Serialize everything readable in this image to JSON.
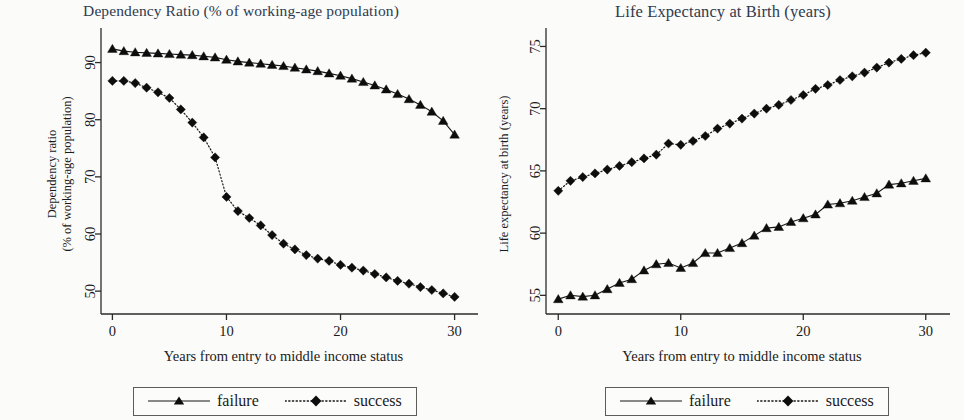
{
  "figure": {
    "background": "#fbfbfa",
    "title_color": "#2f3a4e",
    "series_color": "#0d0d0d"
  },
  "panels": [
    {
      "id": "dependency-ratio",
      "title": "Dependency Ratio (% of working-age population)",
      "y_axis_title_line1": "Dependency ratio",
      "y_axis_title_line2": "(% of working-age population)",
      "x_axis_title": "Years from entry to middle income status",
      "y_ticks": [
        "50",
        "60",
        "70",
        "80",
        "90"
      ],
      "x_ticks": [
        "0",
        "10",
        "20",
        "30"
      ],
      "legend": [
        {
          "label": "failure",
          "marker": "triangle",
          "line": "solid"
        },
        {
          "label": "success",
          "marker": "diamond",
          "line": "dotted"
        }
      ]
    },
    {
      "id": "life-expectancy",
      "title": "Life Expectancy at Birth (years)",
      "y_axis_title_line1": "Life expectancy at birth (years)",
      "y_axis_title_line2": "",
      "x_axis_title": "Years from entry to middle income status",
      "y_ticks": [
        "55",
        "60",
        "65",
        "70",
        "75"
      ],
      "x_ticks": [
        "0",
        "10",
        "20",
        "30"
      ],
      "legend": [
        {
          "label": "failure",
          "marker": "triangle",
          "line": "solid"
        },
        {
          "label": "success",
          "marker": "diamond",
          "line": "dotted"
        }
      ]
    }
  ],
  "chart_data": [
    {
      "type": "line",
      "title": "Dependency Ratio (% of working-age population)",
      "xlabel": "Years from entry to middle income status",
      "ylabel": "Dependency ratio (% of working-age population)",
      "xlim": [
        -1,
        31
      ],
      "ylim": [
        46,
        95
      ],
      "xticks": [
        0,
        10,
        20,
        30
      ],
      "yticks": [
        50,
        60,
        70,
        80,
        90
      ],
      "grid": false,
      "legend_position": "bottom-center",
      "x": [
        0,
        1,
        2,
        3,
        4,
        5,
        6,
        7,
        8,
        9,
        10,
        11,
        12,
        13,
        14,
        15,
        16,
        17,
        18,
        19,
        20,
        21,
        22,
        23,
        24,
        25,
        26,
        27,
        28,
        29,
        30
      ],
      "series": [
        {
          "name": "failure",
          "marker": "triangle",
          "linestyle": "solid",
          "values": [
            92.4,
            92.0,
            91.8,
            91.7,
            91.6,
            91.5,
            91.4,
            91.3,
            91.1,
            90.9,
            90.5,
            90.2,
            90.0,
            89.8,
            89.6,
            89.4,
            89.1,
            88.8,
            88.5,
            88.1,
            87.7,
            87.2,
            86.6,
            86.0,
            85.3,
            84.5,
            83.6,
            82.6,
            81.4,
            79.8,
            77.4
          ]
        },
        {
          "name": "success",
          "marker": "diamond",
          "linestyle": "dotted",
          "values": [
            86.8,
            86.8,
            86.4,
            85.6,
            84.8,
            83.8,
            81.8,
            79.5,
            76.9,
            73.4,
            66.5,
            64.0,
            62.8,
            61.5,
            59.8,
            58.3,
            57.3,
            56.3,
            55.7,
            55.3,
            54.6,
            54.1,
            53.6,
            53.0,
            52.4,
            51.8,
            51.3,
            50.7,
            50.2,
            49.6,
            49.0
          ]
        }
      ]
    },
    {
      "type": "line",
      "title": "Life Expectancy at Birth (years)",
      "xlabel": "Years from entry to middle income status",
      "ylabel": "Life expectancy at birth (years)",
      "xlim": [
        -1,
        31
      ],
      "ylim": [
        53.5,
        76
      ],
      "xticks": [
        0,
        10,
        20,
        30
      ],
      "yticks": [
        55,
        60,
        65,
        70,
        75
      ],
      "grid": false,
      "legend_position": "bottom-center",
      "x": [
        0,
        1,
        2,
        3,
        4,
        5,
        6,
        7,
        8,
        9,
        10,
        11,
        12,
        13,
        14,
        15,
        16,
        17,
        18,
        19,
        20,
        21,
        22,
        23,
        24,
        25,
        26,
        27,
        28,
        29,
        30
      ],
      "series": [
        {
          "name": "failure",
          "marker": "triangle",
          "linestyle": "solid",
          "values": [
            54.7,
            55.0,
            54.9,
            55.0,
            55.5,
            56.0,
            56.3,
            57.0,
            57.5,
            57.6,
            57.2,
            57.6,
            58.4,
            58.4,
            58.8,
            59.2,
            59.8,
            60.4,
            60.5,
            60.9,
            61.2,
            61.5,
            62.3,
            62.4,
            62.6,
            62.9,
            63.2,
            63.9,
            64.0,
            64.2,
            64.4
          ]
        },
        {
          "name": "success",
          "marker": "diamond",
          "linestyle": "dotted",
          "values": [
            63.4,
            64.2,
            64.5,
            64.8,
            65.1,
            65.4,
            65.7,
            66.0,
            66.3,
            67.2,
            67.1,
            67.4,
            67.8,
            68.4,
            68.8,
            69.2,
            69.6,
            70.0,
            70.3,
            70.7,
            71.1,
            71.6,
            71.9,
            72.3,
            72.6,
            72.9,
            73.3,
            73.7,
            74.0,
            74.3,
            74.5
          ]
        }
      ]
    }
  ]
}
